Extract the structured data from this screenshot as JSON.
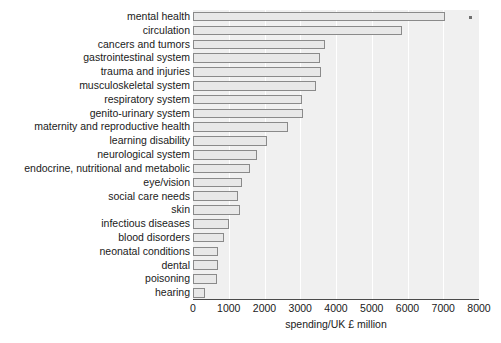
{
  "chart": {
    "axis_title": "spending/UK £ million",
    "tick_labels": [
      "0",
      "1000",
      "2000",
      "3000",
      "4000",
      "5000",
      "6000",
      "7000",
      "8000"
    ],
    "bar_fill": "#e8e8e8",
    "bar_stroke": "#8a8a8a",
    "plot_background": "#f0f0f0",
    "grid_color": "#ffffff",
    "marker_name": "stray-marker-dot"
  },
  "chart_data": {
    "type": "bar",
    "orientation": "horizontal",
    "title": "",
    "xlabel": "spending/UK £ million",
    "ylabel": "",
    "xlim": [
      0,
      8000
    ],
    "xticks": [
      0,
      1000,
      2000,
      3000,
      4000,
      5000,
      6000,
      7000,
      8000
    ],
    "grid": true,
    "legend": false,
    "categories": [
      "mental health",
      "circulation",
      "cancers and tumors",
      "gastrointestinal system",
      "trauma and injuries",
      "musculoskeletal system",
      "respiratory system",
      "genito-urinary system",
      "maternity and reproductive health",
      "learning disability",
      "neurological system",
      "endocrine, nutritional and metabolic",
      "eye/vision",
      "social care needs",
      "skin",
      "infectious diseases",
      "blood disorders",
      "neonatal conditions",
      "dental",
      "poisoning",
      "hearing"
    ],
    "values": [
      7050,
      5840,
      3680,
      3540,
      3570,
      3450,
      3060,
      3090,
      2670,
      2080,
      1800,
      1600,
      1380,
      1260,
      1320,
      1010,
      870,
      700,
      700,
      680,
      330
    ]
  }
}
